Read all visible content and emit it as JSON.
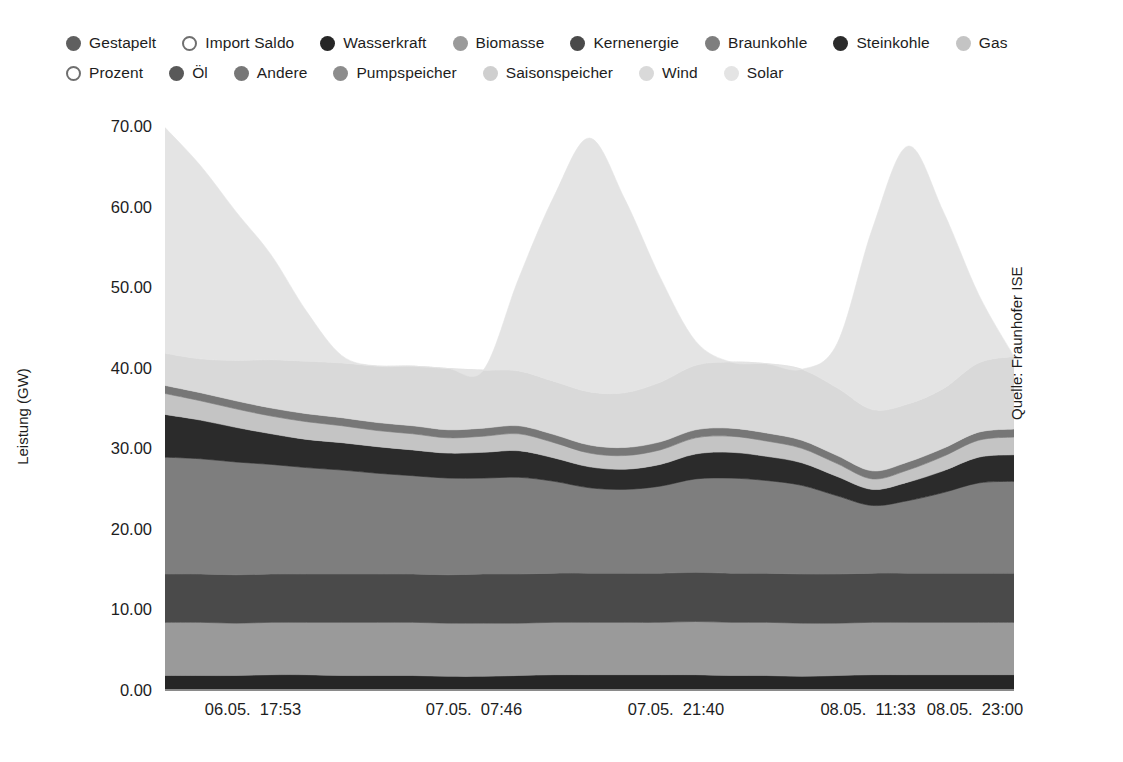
{
  "legend": {
    "rows": [
      [
        {
          "label": "Gestapelt",
          "color": "#5f5f5f",
          "style": "filled",
          "icon": "circle-filled-icon"
        },
        {
          "label": "Import Saldo",
          "color": "#f2f2f2",
          "style": "hollow",
          "icon": "circle-hollow-icon"
        },
        {
          "label": "Wasserkraft",
          "color": "#262626",
          "style": "filled",
          "icon": "circle-filled-icon"
        },
        {
          "label": "Biomasse",
          "color": "#9a9a9a",
          "style": "filled",
          "icon": "circle-filled-icon"
        },
        {
          "label": "Kernenergie",
          "color": "#4a4a4a",
          "style": "filled",
          "icon": "circle-filled-icon"
        },
        {
          "label": "Braunkohle",
          "color": "#7e7e7e",
          "style": "filled",
          "icon": "circle-filled-icon"
        },
        {
          "label": "Steinkohle",
          "color": "#2b2b2b",
          "style": "filled",
          "icon": "circle-filled-icon"
        },
        {
          "label": "Gas",
          "color": "#c4c4c4",
          "style": "filled",
          "icon": "circle-filled-icon"
        }
      ],
      [
        {
          "label": "Prozent",
          "color": "#ffffff",
          "style": "hollow",
          "icon": "circle-hollow-icon"
        },
        {
          "label": "Öl",
          "color": "#595959",
          "style": "filled",
          "icon": "circle-filled-icon"
        },
        {
          "label": "Andere",
          "color": "#777777",
          "style": "filled",
          "icon": "circle-filled-icon"
        },
        {
          "label": "Pumpspeicher",
          "color": "#8c8c8c",
          "style": "filled",
          "icon": "circle-filled-icon"
        },
        {
          "label": "Saisonspeicher",
          "color": "#cfcfcf",
          "style": "filled",
          "icon": "circle-filled-icon"
        },
        {
          "label": "Wind",
          "color": "#d9d9d9",
          "style": "filled",
          "icon": "circle-filled-icon"
        },
        {
          "label": "Solar",
          "color": "#e4e4e4",
          "style": "filled",
          "icon": "circle-filled-icon"
        }
      ]
    ]
  },
  "axes": {
    "y_title": "Leistung (GW)",
    "y_ticks": [
      "0.00",
      "10.00",
      "20.00",
      "30.00",
      "40.00",
      "50.00",
      "60.00",
      "70.00"
    ],
    "x_ticks": [
      "06.05.  17:53",
      "07.05.  07:46",
      "07.05.  21:40",
      "08.05.  11:33",
      "08.05.  23:00"
    ]
  },
  "source": {
    "text": "Quelle: Fraunhofer ISE"
  },
  "chart_data": {
    "type": "area",
    "title": "",
    "xlabel": "",
    "ylabel": "Leistung (GW)",
    "ylim": [
      0,
      70
    ],
    "yticks": [
      0,
      10,
      20,
      30,
      40,
      50,
      60,
      70
    ],
    "grid": false,
    "legend_position": "top",
    "stacked": true,
    "x": [
      "06.05. 12:00",
      "06.05. 14:00",
      "06.05. 16:00",
      "06.05. 17:53",
      "06.05. 20:00",
      "06.05. 22:00",
      "07.05. 00:00",
      "07.05. 02:00",
      "07.05. 04:00",
      "07.05. 07:46",
      "07.05. 10:00",
      "07.05. 12:00",
      "07.05. 14:00",
      "07.05. 16:00",
      "07.05. 18:00",
      "07.05. 21:40",
      "08.05. 00:00",
      "08.05. 02:00",
      "08.05. 05:00",
      "08.05. 08:00",
      "08.05. 11:33",
      "08.05. 14:00",
      "08.05. 17:00",
      "08.05. 20:00",
      "08.05. 23:00"
    ],
    "x_tick_labels": [
      "06.05.  17:53",
      "07.05.  07:46",
      "07.05.  21:40",
      "08.05.  11:33",
      "08.05.  23:00"
    ],
    "series": [
      {
        "name": "Wasserkraft",
        "color": "#262626",
        "values": [
          1.8,
          1.8,
          1.8,
          1.9,
          1.9,
          1.8,
          1.8,
          1.8,
          1.7,
          1.7,
          1.8,
          1.9,
          1.9,
          1.9,
          1.9,
          1.9,
          1.8,
          1.8,
          1.7,
          1.8,
          1.9,
          1.9,
          1.9,
          1.9,
          1.9
        ]
      },
      {
        "name": "Biomasse",
        "color": "#9a9a9a",
        "values": [
          6.6,
          6.6,
          6.5,
          6.5,
          6.5,
          6.6,
          6.6,
          6.6,
          6.6,
          6.6,
          6.5,
          6.5,
          6.5,
          6.5,
          6.5,
          6.6,
          6.6,
          6.6,
          6.6,
          6.5,
          6.5,
          6.5,
          6.5,
          6.5,
          6.5
        ]
      },
      {
        "name": "Kernenergie",
        "color": "#4a4a4a",
        "values": [
          6.0,
          6.0,
          6.0,
          6.0,
          6.0,
          6.0,
          6.0,
          6.0,
          6.0,
          6.1,
          6.1,
          6.1,
          6.1,
          6.1,
          6.1,
          6.1,
          6.1,
          6.1,
          6.1,
          6.1,
          6.1,
          6.1,
          6.1,
          6.1,
          6.1
        ]
      },
      {
        "name": "Braunkohle",
        "color": "#7e7e7e",
        "values": [
          14.5,
          14.3,
          14.0,
          13.6,
          13.2,
          12.9,
          12.5,
          12.2,
          12.0,
          11.9,
          12.0,
          11.4,
          10.6,
          10.4,
          10.8,
          11.6,
          11.8,
          11.5,
          11.0,
          9.7,
          8.4,
          9.0,
          10.0,
          11.2,
          11.4
        ]
      },
      {
        "name": "Steinkohle",
        "color": "#2b2b2b",
        "values": [
          5.3,
          4.8,
          4.3,
          3.8,
          3.5,
          3.4,
          3.3,
          3.2,
          3.1,
          3.2,
          3.3,
          2.9,
          2.6,
          2.5,
          2.7,
          3.1,
          3.2,
          3.0,
          2.8,
          2.4,
          2.0,
          2.3,
          2.7,
          3.2,
          3.3
        ]
      },
      {
        "name": "Gas",
        "color": "#c4c4c4",
        "values": [
          2.6,
          2.4,
          2.3,
          2.2,
          2.2,
          2.1,
          2.0,
          2.0,
          1.9,
          2.0,
          2.1,
          1.9,
          1.7,
          1.7,
          1.8,
          2.0,
          2.0,
          1.9,
          1.8,
          1.6,
          1.3,
          1.5,
          1.8,
          2.1,
          2.2
        ]
      },
      {
        "name": "Andere",
        "color": "#777777",
        "values": [
          1.0,
          1.0,
          1.0,
          1.0,
          1.0,
          1.0,
          1.0,
          1.0,
          1.0,
          1.0,
          1.0,
          1.0,
          1.0,
          1.0,
          1.0,
          1.0,
          1.0,
          1.0,
          1.0,
          1.0,
          1.0,
          1.0,
          1.0,
          1.0,
          1.0
        ]
      },
      {
        "name": "Wind",
        "color": "#d9d9d9",
        "values": [
          4.0,
          4.2,
          5.0,
          6.0,
          6.5,
          6.8,
          7.0,
          7.4,
          7.6,
          7.2,
          6.8,
          6.6,
          6.6,
          6.8,
          7.4,
          8.0,
          8.2,
          8.6,
          8.8,
          8.4,
          7.6,
          7.2,
          7.4,
          8.6,
          9.0
        ]
      },
      {
        "name": "Solar",
        "color": "#e4e4e4",
        "values": [
          28.0,
          24.0,
          18.5,
          13.0,
          6.2,
          0.9,
          0.0,
          0.0,
          0.0,
          0.0,
          11.5,
          23.0,
          31.5,
          24.0,
          13.0,
          3.0,
          0.0,
          0.0,
          0.0,
          5.5,
          22.5,
          32.0,
          22.0,
          8.5,
          0.0
        ]
      }
    ],
    "annotations": [
      "Quelle: Fraunhofer ISE"
    ],
    "peaks_gw": [
      70.0,
      66.5,
      65.8
    ],
    "final_total_gw": 50.4
  }
}
